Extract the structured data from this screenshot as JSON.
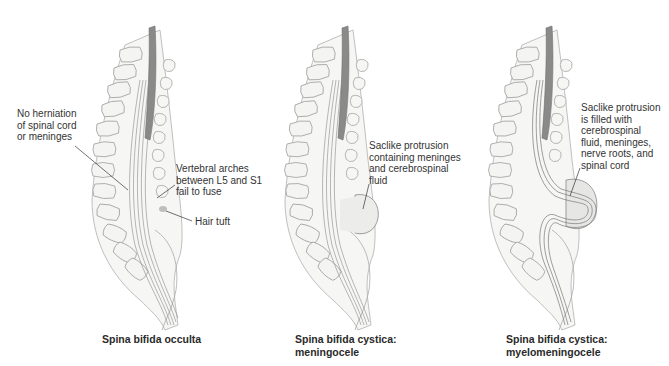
{
  "panels": [
    {
      "id": "occulta",
      "caption": "Spina bifida occulta",
      "labels": [
        {
          "id": "no-herniation",
          "text": "No herniation\nof spinal cord\nor meninges"
        },
        {
          "id": "vertebral-arches",
          "text": "Vertebral arches\nbetween L5 and S1\nfail to fuse"
        },
        {
          "id": "hair-tuft",
          "text": "Hair tuft"
        }
      ]
    },
    {
      "id": "meningocele",
      "caption": "Spina bifida cystica:\nmeningocele",
      "labels": [
        {
          "id": "saclike-meninges",
          "text": "Saclike protrusion\ncontaining meninges\nand cerebrospinal\nfluid"
        }
      ]
    },
    {
      "id": "myelomeningocele",
      "caption": "Spina bifida cystica:\nmyelomeningocele",
      "labels": [
        {
          "id": "saclike-cord",
          "text": "Saclike protrusion\nis filled with\ncerebrospinal\nfluid, meninges,\nnerve roots, and\nspinal cord"
        }
      ]
    }
  ],
  "colors": {
    "bone_fill": "#f4f4f2",
    "bone_stroke": "#9a9a9a",
    "cord_dark": "#8a8a8a",
    "sac_fill": "#ececea",
    "leader": "#333333"
  }
}
